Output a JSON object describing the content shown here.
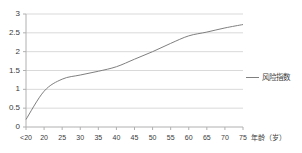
{
  "chart_data": {
    "type": "line",
    "title": "",
    "xlabel": "年龄（岁）",
    "ylabel": "",
    "categories": [
      "<20",
      "20",
      "25",
      "30",
      "35",
      "40",
      "45",
      "50",
      "55",
      "60",
      "65",
      "70",
      "75"
    ],
    "series": [
      {
        "name": "风险指数",
        "values": [
          0.2,
          0.95,
          1.27,
          1.38,
          1.48,
          1.6,
          1.8,
          2.0,
          2.22,
          2.42,
          2.52,
          2.63,
          2.72
        ],
        "color": "#7f7f7f"
      }
    ],
    "ylim": [
      0,
      3
    ],
    "yticks": [
      "0",
      "0.5",
      "1",
      "1.5",
      "2",
      "2.5",
      "3"
    ],
    "ytick_values": [
      0,
      0.5,
      1,
      1.5,
      2,
      2.5,
      3
    ],
    "grid": true,
    "grid_color": "#d9d9d9",
    "axis_color": "#b0b0b0",
    "legend_position": "right",
    "legend": [
      "风险指数"
    ]
  },
  "axis": {
    "x_title": "年龄（岁）",
    "y_title": ""
  },
  "legend": {
    "items": [
      {
        "label": "风险指数",
        "color": "#7f7f7f"
      }
    ]
  }
}
